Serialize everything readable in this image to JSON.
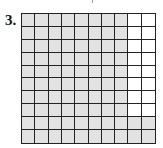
{
  "problem": {
    "number": "3."
  },
  "grid": {
    "rows": 10,
    "cols": 10,
    "shaded_per_row": [
      8,
      8,
      8,
      8,
      8,
      8,
      8,
      8,
      10,
      10
    ],
    "shaded_total": 84,
    "shade_color": "#e2e2e2",
    "line_color": "#222222"
  }
}
